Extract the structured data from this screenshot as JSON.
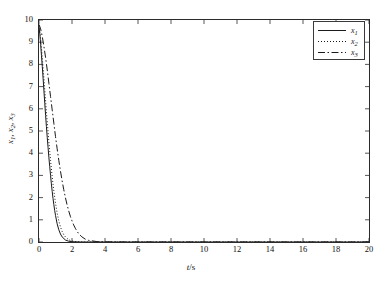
{
  "chart_data": {
    "type": "line",
    "title": "",
    "xlabel": "t/s",
    "ylabel": "x1, x2, x3",
    "xlim": [
      0,
      20
    ],
    "ylim": [
      0,
      10
    ],
    "xticks": [
      0,
      2,
      4,
      6,
      8,
      10,
      12,
      14,
      16,
      18,
      20
    ],
    "yticks": [
      0,
      1,
      2,
      3,
      4,
      5,
      6,
      7,
      8,
      9,
      10
    ],
    "xtick_labels": [
      "0",
      "2",
      "4",
      "6",
      "8",
      "10",
      "12",
      "14",
      "16",
      "18",
      "20"
    ],
    "ytick_labels": [
      "0",
      "1",
      "2",
      "3",
      "4",
      "5",
      "6",
      "7",
      "8",
      "9",
      "10"
    ],
    "grid": false,
    "legend_position": "upper right",
    "series": [
      {
        "name": "x1",
        "style": "solid",
        "color": "#1a1a1a",
        "x": [
          0,
          0.05,
          0.1,
          0.15,
          0.2,
          0.25,
          0.3,
          0.35,
          0.4,
          0.45,
          0.5,
          0.55,
          0.6,
          0.65,
          0.7,
          0.75,
          0.8,
          0.85,
          0.9,
          0.95,
          1.0,
          1.1,
          1.2,
          1.3,
          1.4,
          1.6,
          1.8,
          2.0,
          2.5,
          3.0,
          4.0,
          6.0,
          10.0,
          20.0
        ],
        "y": [
          9.7,
          9.35,
          8.9,
          8.4,
          7.9,
          7.35,
          6.8,
          6.25,
          5.7,
          5.2,
          4.7,
          4.25,
          3.8,
          3.4,
          3.0,
          2.62,
          2.28,
          1.96,
          1.68,
          1.42,
          1.2,
          0.82,
          0.55,
          0.36,
          0.23,
          0.09,
          0.035,
          0.012,
          0.002,
          0.0,
          0.0,
          0.0,
          0.0,
          0.0
        ]
      },
      {
        "name": "x2",
        "style": "dotted",
        "color": "#1a1a1a",
        "x": [
          0,
          0.05,
          0.1,
          0.15,
          0.2,
          0.25,
          0.3,
          0.35,
          0.4,
          0.45,
          0.5,
          0.55,
          0.6,
          0.65,
          0.7,
          0.75,
          0.8,
          0.85,
          0.9,
          0.95,
          1.0,
          1.1,
          1.2,
          1.3,
          1.4,
          1.5,
          1.6,
          1.8,
          2.0,
          2.3,
          2.6,
          3.0,
          4.0,
          6.0,
          10.0,
          20.0
        ],
        "y": [
          9.75,
          9.5,
          9.15,
          8.75,
          8.3,
          7.85,
          7.35,
          6.85,
          6.35,
          5.85,
          5.4,
          4.95,
          4.5,
          4.08,
          3.68,
          3.3,
          2.94,
          2.6,
          2.3,
          2.02,
          1.76,
          1.3,
          0.95,
          0.68,
          0.48,
          0.33,
          0.23,
          0.1,
          0.045,
          0.014,
          0.005,
          0.0,
          0.0,
          0.0,
          0.0,
          0.0
        ]
      },
      {
        "name": "x3",
        "style": "dashdot",
        "color": "#1a1a1a",
        "x": [
          0,
          0.1,
          0.2,
          0.3,
          0.4,
          0.5,
          0.6,
          0.7,
          0.8,
          0.9,
          1.0,
          1.1,
          1.2,
          1.3,
          1.4,
          1.5,
          1.6,
          1.7,
          1.8,
          1.9,
          2.0,
          2.1,
          2.2,
          2.3,
          2.4,
          2.6,
          2.8,
          3.0,
          3.5,
          4.0,
          5.0,
          7.0,
          10.0,
          20.0
        ],
        "y": [
          9.8,
          9.6,
          9.25,
          8.8,
          8.3,
          7.75,
          7.15,
          6.55,
          5.95,
          5.35,
          4.75,
          4.2,
          3.68,
          3.2,
          2.76,
          2.36,
          2.0,
          1.68,
          1.4,
          1.16,
          0.95,
          0.77,
          0.62,
          0.49,
          0.38,
          0.23,
          0.13,
          0.075,
          0.02,
          0.006,
          0.001,
          0.0,
          0.0,
          0.0
        ]
      }
    ],
    "legend": [
      {
        "label": "x",
        "sub": "1",
        "style": "solid"
      },
      {
        "label": "x",
        "sub": "2",
        "style": "dotted"
      },
      {
        "label": "x",
        "sub": "3",
        "style": "dashdot"
      }
    ],
    "axis_label_parts": {
      "x_base": "t",
      "x_rest": "/s",
      "y_base": "x",
      "y_sub1": "1",
      "y_sub2": "2",
      "y_sub3": "3"
    }
  }
}
